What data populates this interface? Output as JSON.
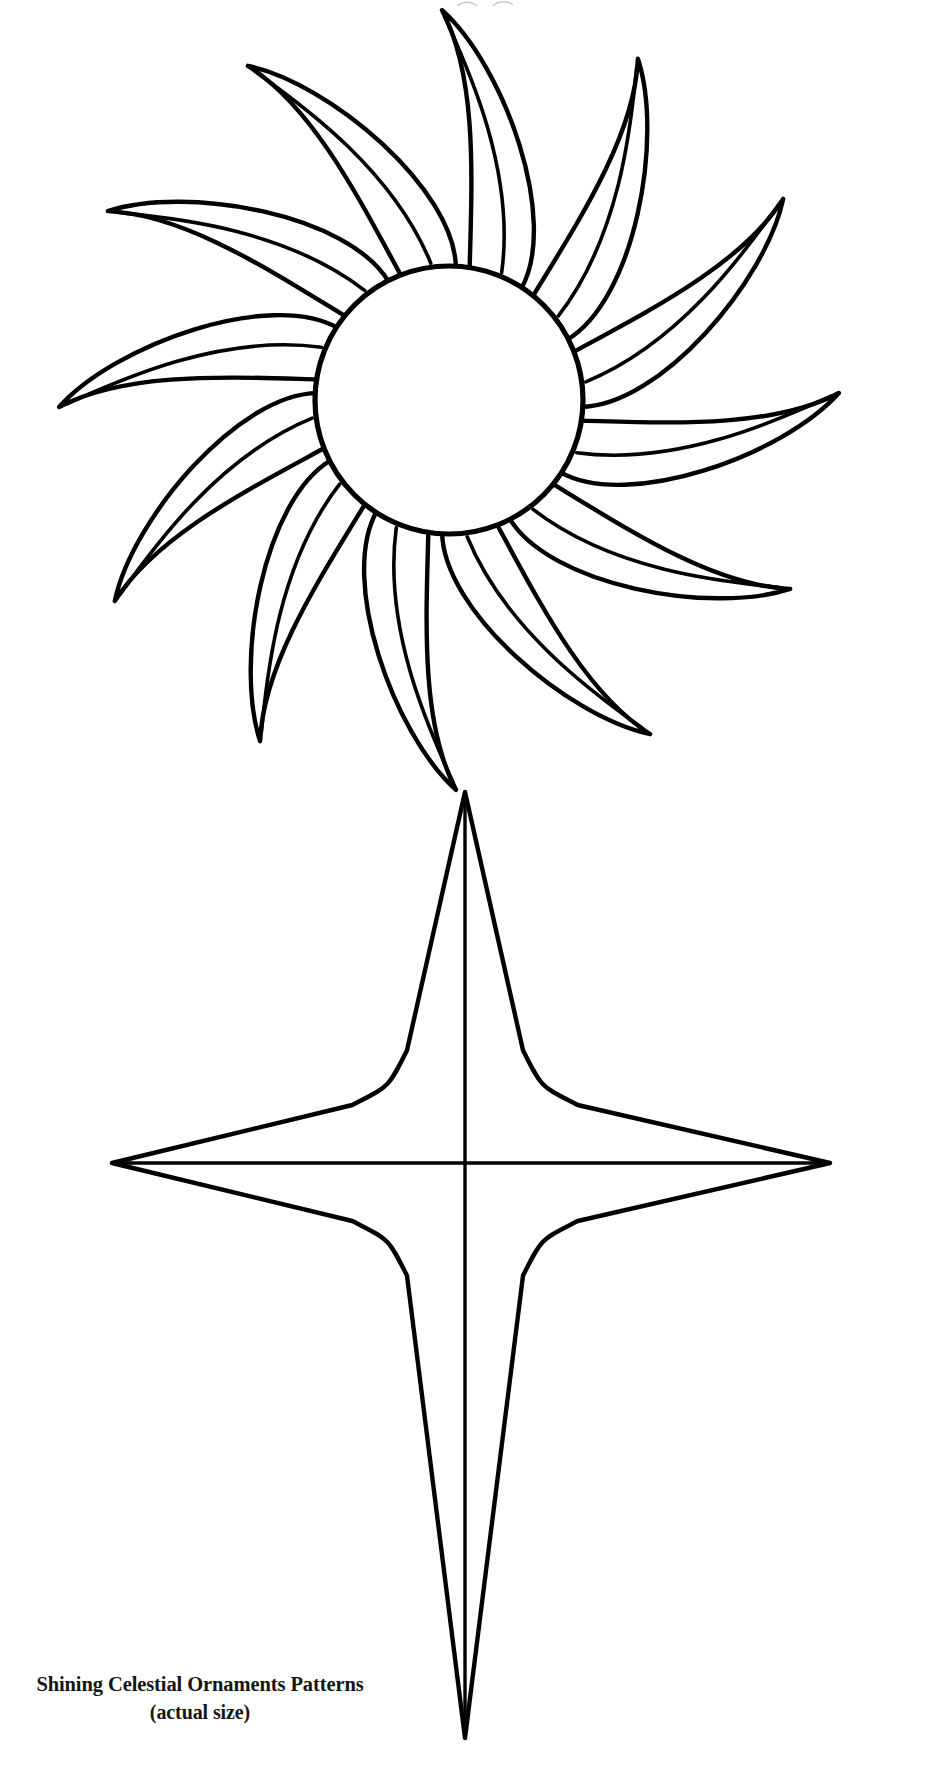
{
  "document": {
    "kind": "craft-pattern-sheet",
    "background_color": "#ffffff",
    "ink_color": "#000000",
    "page_width": 945,
    "page_height": 1768
  },
  "caption": {
    "title": "Shining Celestial Ornaments Patterns",
    "subtitle": "(actual size)"
  },
  "figures": {
    "sun": {
      "name": "twelve-rayed sun pattern",
      "center_x": 449,
      "center_y": 400,
      "core_radius": 134,
      "ray_count": 12,
      "ray_inner_radius": 134,
      "ray_outer_radius": 390,
      "rotation_offset_deg": -9
    },
    "star": {
      "name": "four-pointed celestial star pattern",
      "center_x": 465,
      "center_y": 1163,
      "top_tip_y": 792,
      "bottom_tip_y": 1738,
      "left_tip_x": 112,
      "right_tip_x": 830,
      "shoulder_offset": 46,
      "shoulder_half_width": 58,
      "has_center_crosshair": true
    }
  },
  "top_artifact": {
    "label": "cut-off page mark"
  }
}
